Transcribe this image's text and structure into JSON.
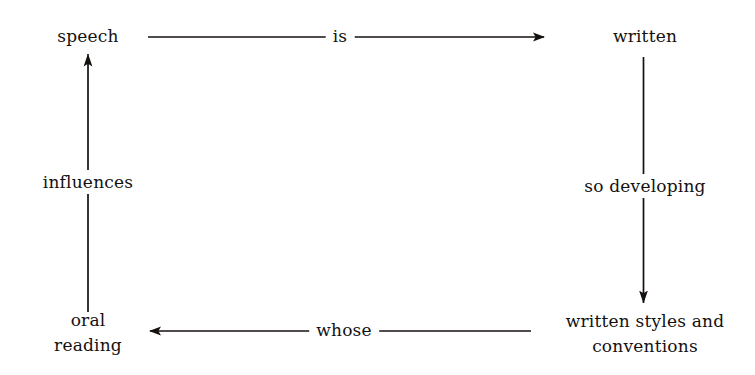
{
  "diagram": {
    "background_color": "#ffffff",
    "ink_color": "#14110f",
    "nodes": [
      {
        "id": "speech",
        "label": "speech",
        "label_lines": [
          "speech"
        ]
      },
      {
        "id": "written",
        "label": "written",
        "label_lines": [
          "written"
        ]
      },
      {
        "id": "written-styles",
        "label": "written styles and conventions",
        "label_lines": [
          "written styles and",
          "conventions"
        ]
      },
      {
        "id": "oral-reading",
        "label": "oral reading",
        "label_lines": [
          "oral",
          "reading"
        ]
      }
    ],
    "edges": [
      {
        "id": "speech-to-written",
        "label": "is",
        "from": "speech",
        "to": "written",
        "direction": "right"
      },
      {
        "id": "written-to-written-styles",
        "label": "so developing",
        "from": "written",
        "to": "written-styles",
        "direction": "down"
      },
      {
        "id": "written-styles-to-oral-reading",
        "label": "whose",
        "from": "written-styles",
        "to": "oral-reading",
        "direction": "left"
      },
      {
        "id": "oral-reading-to-speech",
        "label": "influences",
        "from": "oral-reading",
        "to": "speech",
        "direction": "up"
      }
    ]
  }
}
